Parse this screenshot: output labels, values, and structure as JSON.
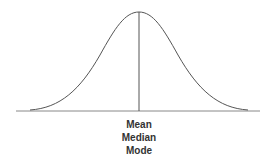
{
  "diagram": {
    "labels": [
      "Mean",
      "Median",
      "Mode"
    ],
    "colors": {
      "curve": "#555555",
      "axis": "#888888",
      "center_line": "#555555",
      "text": "#333333"
    }
  }
}
